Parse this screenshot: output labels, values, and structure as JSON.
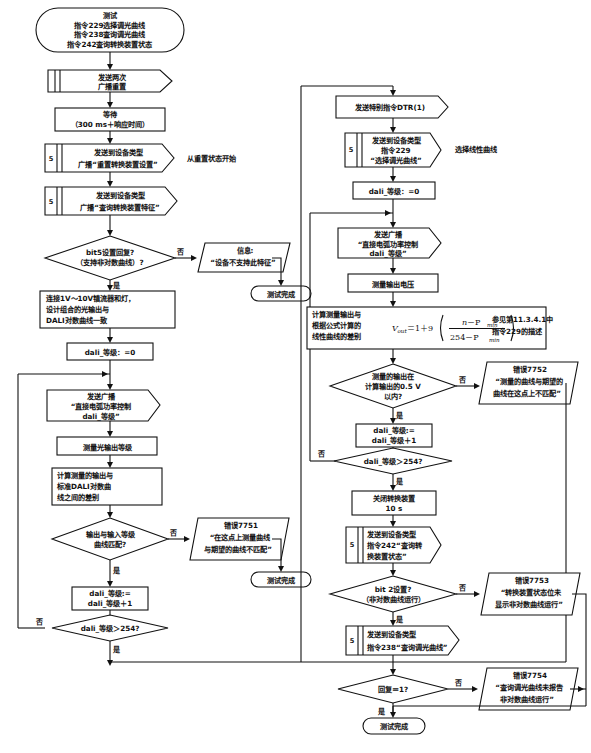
{
  "diagram": {
    "language": "zh-CN",
    "type": "flowchart",
    "labels": {
      "yes": "是",
      "no": "否"
    }
  },
  "left_branch": {
    "start": {
      "line1": "测试",
      "line2": "指令229选择调光曲线",
      "line3": "指令238查询调光曲线",
      "line4": "指令242查询转换装置状态"
    },
    "send_reset": {
      "line1": "发送两次",
      "line2": "广播重置"
    },
    "wait": {
      "line1": "等待",
      "line2": "（300 ms＋响应时间）"
    },
    "broadcast_reset_conv": {
      "line1": "发送到设备类型",
      "line2": "广播“重置转换装置设置”",
      "marker": "5"
    },
    "note_from_reset": "从重置状态开始",
    "broadcast_query_feature": {
      "line1": "发送到设备类型",
      "line2": "广播“查询转换装置特征”",
      "marker": "5"
    },
    "decision_bit5": {
      "line1": "bit5设置回复?",
      "line2": "（支持非对数曲线）?"
    },
    "info_not_supported": {
      "line1": "信息:",
      "line2": "“设备不支持此特征”"
    },
    "test_complete_1": "测试完成",
    "connect_ballast": {
      "line1": "连接1V～10V镇流器和灯，",
      "line2": "设计组合的光输出与",
      "line3": "DALI对数曲线一致"
    },
    "dali_level_zero": "dali_等级：=0",
    "broadcast_arc_power": {
      "line1": "发送广播",
      "line2": "“直接电弧功率控制",
      "line3": "dali_等级”"
    },
    "measure_light": "测量光输出等级",
    "calc_diff": {
      "line1": "计算测量的输出与",
      "line2": "标准DALI对数曲",
      "line3": "线之间的差别"
    },
    "decision_curve_match": {
      "line1": "输出与输入等级",
      "line2": "曲线匹配?"
    },
    "error_7751": {
      "line1": "错误7751",
      "line2": "“在这点上测量曲线",
      "line3": "与期望的曲线不匹配”"
    },
    "test_complete_2": "测试完成",
    "increment": {
      "line1": "dali_等级:=",
      "line2": "dali_等级＋1"
    },
    "decision_gt_254": "dali_等级＞254?"
  },
  "right_branch": {
    "send_dtr": "发送特别指令DTR(1)",
    "send_cmd_229": {
      "line1": "发送到设备类型",
      "line2": "指令229",
      "line3": "“选择调光曲线”",
      "marker": "5"
    },
    "note_linear_curve": "选择线性曲线",
    "dali_level_zero": "dali_等级：=0",
    "broadcast_arc_power": {
      "line1": "发送广播",
      "line2": "“直接电弧功率控制",
      "line3": "dali_等级”"
    },
    "measure_voltage": "测量输出电压",
    "calc_linear_diff": {
      "line1": "计算测量输出与",
      "line2": "根据公式计算的",
      "line3": "线性曲线的差别"
    },
    "formula": {
      "lhs": "V",
      "lhs_sub": "out",
      "eq": "＝1＋9",
      "num_a": "n",
      "num_b": "－P",
      "num_sub": "min",
      "den_a": "254－P",
      "den_sub": "min"
    },
    "note_reference": {
      "line1": "参见第11.3.4.1中",
      "line2": "指令229的描述"
    },
    "decision_within_05v": {
      "line1": "测量的输出在",
      "line2": "计算输出的0.5 V",
      "line3": "以内?"
    },
    "error_7752": {
      "line1": "错误7752",
      "line2": "“测量的曲线与期望的",
      "line3": "曲线在这点上不匹配”"
    },
    "increment": {
      "line1": "dali_等级:=",
      "line2": "dali_等级＋1"
    },
    "decision_gt_254": "dali_等级＞254?",
    "turn_off": {
      "line1": "关闭转换装置",
      "line2": "10 s"
    },
    "send_cmd_242": {
      "line1": "发送到设备类型",
      "line2": "指令242“查询转",
      "line3": "换装置状态”",
      "marker": "5"
    },
    "decision_bit2": {
      "line1": "bit 2设置?",
      "line2": "（非对数曲线运行）"
    },
    "error_7753": {
      "line1": "错误7753",
      "line2": "“转换装置状态位未",
      "line3": "显示非对数曲线运行”"
    },
    "send_cmd_238": {
      "line1": "发送到设备类型",
      "line2": "指令238“查询调光曲线”",
      "marker": "5"
    },
    "decision_reply_1": "回复＝1?",
    "error_7754": {
      "line1": "错误7754",
      "line2": "“查询调光曲线未报告",
      "line3": "非对数曲线运行”"
    },
    "test_complete_3": "测试完成"
  },
  "colors": {
    "stroke": "#111111",
    "fill": "#ffffff",
    "background": "#ffffff"
  }
}
